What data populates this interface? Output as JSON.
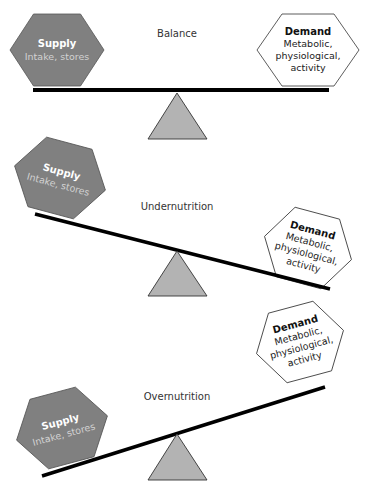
{
  "diagram": {
    "colors": {
      "supply_fill": "#808080",
      "supply_stroke": "#555555",
      "supply_title": "#ffffff",
      "supply_subtitle": "#d2d2d2",
      "demand_fill": "#ffffff",
      "demand_stroke": "#333333",
      "beam": "#000000",
      "fulcrum_fill": "#b3b3b3",
      "fulcrum_stroke": "#333333"
    },
    "panels": [
      {
        "state": "Balance",
        "supply": {
          "title": "Supply",
          "subtitle": "Intake, stores"
        },
        "demand": {
          "title": "Demand",
          "lines": [
            "Metabolic,",
            "physiological,",
            "activity"
          ]
        }
      },
      {
        "state": "Undernutrition",
        "supply": {
          "title": "Supply",
          "subtitle": "Intake, stores"
        },
        "demand": {
          "title": "Demand",
          "lines": [
            "Metabolic,",
            "physiological,",
            "activity"
          ]
        }
      },
      {
        "state": "Overnutrition",
        "supply": {
          "title": "Supply",
          "subtitle": "Intake, stores"
        },
        "demand": {
          "title": "Demand",
          "lines": [
            "Metabolic,",
            "physiological,",
            "activity"
          ]
        }
      }
    ]
  }
}
